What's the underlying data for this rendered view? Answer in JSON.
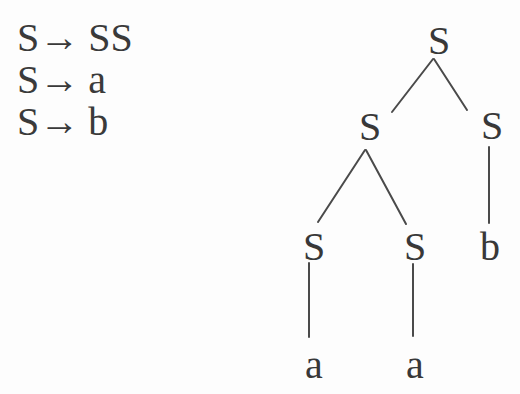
{
  "figure": {
    "background_color": "#fdfdfd",
    "ink_color": "#3a3a3a",
    "edge_color": "#4a4a4a"
  },
  "grammar": {
    "rules": [
      {
        "lhs": "S",
        "arrow": "→",
        "rhs": "SS"
      },
      {
        "lhs": "S",
        "arrow": "→",
        "rhs": "a"
      },
      {
        "lhs": "S",
        "arrow": "→",
        "rhs": "b"
      }
    ]
  },
  "parse_tree": {
    "nodes": [
      {
        "id": "root",
        "label": "S"
      },
      {
        "id": "child-left",
        "label": "S"
      },
      {
        "id": "child-right",
        "label": "S"
      },
      {
        "id": "grandchild-left",
        "label": "S"
      },
      {
        "id": "grandchild-mid",
        "label": "S"
      },
      {
        "id": "leaf-b",
        "label": "b"
      },
      {
        "id": "leaf-a-left",
        "label": "a"
      },
      {
        "id": "leaf-a-mid",
        "label": "a"
      }
    ]
  }
}
